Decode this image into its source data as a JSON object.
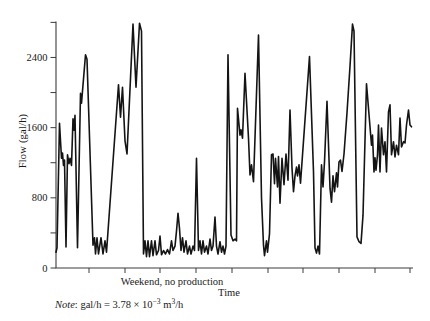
{
  "figure": {
    "ylabel": "Flow (gal/h)",
    "xlabel": "Time",
    "annotation": "Weekend, no production",
    "note": {
      "prefix": "Note",
      "body1": ": gal/h = 3.78 × 10",
      "sup1": "−3",
      "body2": " m",
      "sup2": "3",
      "body3": "/h"
    },
    "line_color": "#141414",
    "axis_color": "#3c3c3c",
    "background": "#ffffff"
  },
  "chart_data": {
    "type": "line",
    "title": "",
    "xlabel": "Time",
    "ylabel": "Flow (gal/h)",
    "ylim": [
      0,
      2810
    ],
    "y_ticks": [
      0,
      400,
      800,
      1200,
      1600,
      2000,
      2400,
      2800
    ],
    "y_labeled_ticks": [
      0,
      800,
      1600,
      2400
    ],
    "x_tick_labels": [],
    "x_ticks_px": [
      89,
      125,
      160,
      196,
      232,
      268,
      303,
      339,
      375,
      410
    ],
    "grid": false,
    "legend": "none",
    "annotation": "Weekend, no production",
    "plot_px": {
      "left": 56,
      "bottom": 268,
      "top": 21.5,
      "right": 413
    },
    "series": [
      {
        "name": "flow-gal-per-h",
        "points": [
          [
            56,
            180
          ],
          [
            57,
            230
          ],
          [
            59.5,
            1650
          ],
          [
            61.5,
            1250
          ],
          [
            62.5,
            1310
          ],
          [
            63.5,
            1170
          ],
          [
            64.5,
            1230
          ],
          [
            66,
            240
          ],
          [
            67.5,
            1290
          ],
          [
            69,
            1190
          ],
          [
            70,
            1250
          ],
          [
            71.5,
            1170
          ],
          [
            73,
            1700
          ],
          [
            74,
            1570
          ],
          [
            75,
            1740
          ],
          [
            77.5,
            230
          ],
          [
            80.5,
            1990
          ],
          [
            81.5,
            1880
          ],
          [
            85.5,
            2430
          ],
          [
            87,
            2380
          ],
          [
            93,
            260
          ],
          [
            94.5,
            345
          ],
          [
            95.5,
            160
          ],
          [
            97,
            345
          ],
          [
            98.5,
            160
          ],
          [
            101,
            345
          ],
          [
            103,
            160
          ],
          [
            105,
            310
          ],
          [
            106.5,
            180
          ],
          [
            118.5,
            2090
          ],
          [
            120.5,
            1720
          ],
          [
            122.5,
            2060
          ],
          [
            125,
            1450
          ],
          [
            127,
            1300
          ],
          [
            133,
            2780
          ],
          [
            136,
            2060
          ],
          [
            139.5,
            2790
          ],
          [
            141.5,
            2700
          ],
          [
            143.5,
            160
          ],
          [
            145,
            310
          ],
          [
            146.5,
            130
          ],
          [
            148,
            310
          ],
          [
            149.5,
            130
          ],
          [
            151.5,
            310
          ],
          [
            153,
            140
          ],
          [
            155,
            310
          ],
          [
            156.5,
            150
          ],
          [
            158.5,
            200
          ],
          [
            160,
            365
          ],
          [
            161.5,
            150
          ],
          [
            163.5,
            200
          ],
          [
            165.5,
            160
          ],
          [
            167.5,
            210
          ],
          [
            169.5,
            160
          ],
          [
            171.5,
            310
          ],
          [
            173,
            200
          ],
          [
            175,
            250
          ],
          [
            176.5,
            420
          ],
          [
            178,
            625
          ],
          [
            179.5,
            450
          ],
          [
            181,
            200
          ],
          [
            182.5,
            345
          ],
          [
            184,
            180
          ],
          [
            186,
            310
          ],
          [
            187.5,
            160
          ],
          [
            189.5,
            250
          ],
          [
            191,
            160
          ],
          [
            193,
            250
          ],
          [
            194.5,
            200
          ],
          [
            196.5,
            1250
          ],
          [
            198.5,
            200
          ],
          [
            200,
            310
          ],
          [
            201.5,
            160
          ],
          [
            203,
            310
          ],
          [
            204.5,
            180
          ],
          [
            206.5,
            250
          ],
          [
            208,
            160
          ],
          [
            210,
            330
          ],
          [
            211.5,
            200
          ],
          [
            213,
            250
          ],
          [
            215,
            580
          ],
          [
            216.5,
            250
          ],
          [
            218,
            160
          ],
          [
            220,
            300
          ],
          [
            221.5,
            180
          ],
          [
            223,
            250
          ],
          [
            224.5,
            160
          ],
          [
            226,
            250
          ],
          [
            228,
            2430
          ],
          [
            231,
            375
          ],
          [
            233,
            310
          ],
          [
            235,
            330
          ],
          [
            236.5,
            310
          ],
          [
            237.5,
            1820
          ],
          [
            240,
            1515
          ],
          [
            241,
            1575
          ],
          [
            242.5,
            1480
          ],
          [
            245,
            2220
          ],
          [
            248.5,
            1480
          ],
          [
            250,
            1060
          ],
          [
            251.5,
            1175
          ],
          [
            253.5,
            985
          ],
          [
            258.5,
            2655
          ],
          [
            261.5,
            800
          ],
          [
            263.5,
            260
          ],
          [
            264.5,
            140
          ],
          [
            266.5,
            310
          ],
          [
            267.5,
            180
          ],
          [
            269.5,
            390
          ],
          [
            271.5,
            1290
          ],
          [
            273,
            1300
          ],
          [
            274.5,
            960
          ],
          [
            275.5,
            1250
          ],
          [
            277.5,
            925
          ],
          [
            278.5,
            1270
          ],
          [
            280,
            740
          ],
          [
            282,
            1250
          ],
          [
            284,
            950
          ],
          [
            286,
            1300
          ],
          [
            288,
            1000
          ],
          [
            290,
            1800
          ],
          [
            292,
            1140
          ],
          [
            293.5,
            870
          ],
          [
            295,
            1050
          ],
          [
            296.5,
            1150
          ],
          [
            297.5,
            1050
          ],
          [
            299,
            1175
          ],
          [
            300.5,
            965
          ],
          [
            309.5,
            2410
          ],
          [
            313.5,
            1095
          ],
          [
            315,
            230
          ],
          [
            316.5,
            170
          ],
          [
            318,
            250
          ],
          [
            319.5,
            160
          ],
          [
            321.5,
            1175
          ],
          [
            323,
            925
          ],
          [
            324.5,
            1210
          ],
          [
            327,
            1900
          ],
          [
            330,
            910
          ],
          [
            331.5,
            750
          ],
          [
            333,
            1050
          ],
          [
            334.5,
            870
          ],
          [
            336.5,
            1085
          ],
          [
            337.5,
            925
          ],
          [
            339,
            1210
          ],
          [
            340.5,
            1230
          ],
          [
            342,
            1100
          ],
          [
            344,
            1300
          ],
          [
            347,
            1770
          ],
          [
            350,
            2300
          ],
          [
            352.5,
            2780
          ],
          [
            354,
            2700
          ],
          [
            357,
            355
          ],
          [
            359,
            300
          ],
          [
            361,
            280
          ],
          [
            363,
            600
          ],
          [
            366.5,
            2100
          ],
          [
            371.5,
            1400
          ],
          [
            372.5,
            1515
          ],
          [
            374,
            1095
          ],
          [
            375,
            1255
          ],
          [
            376,
            1115
          ],
          [
            377.5,
            1290
          ],
          [
            378.5,
            1630
          ],
          [
            380,
            1095
          ],
          [
            381.5,
            1595
          ],
          [
            383.5,
            1290
          ],
          [
            385,
            1440
          ],
          [
            386.5,
            1095
          ],
          [
            388.5,
            1780
          ],
          [
            390,
            1860
          ],
          [
            391.5,
            1290
          ],
          [
            393.5,
            1440
          ],
          [
            395,
            1265
          ],
          [
            396.5,
            1400
          ],
          [
            398.5,
            1290
          ],
          [
            400,
            1710
          ],
          [
            401.5,
            1380
          ],
          [
            403.5,
            1440
          ],
          [
            405,
            1425
          ],
          [
            406.5,
            1630
          ],
          [
            408.5,
            1800
          ],
          [
            410,
            1630
          ],
          [
            411.5,
            1610
          ]
        ]
      }
    ]
  }
}
